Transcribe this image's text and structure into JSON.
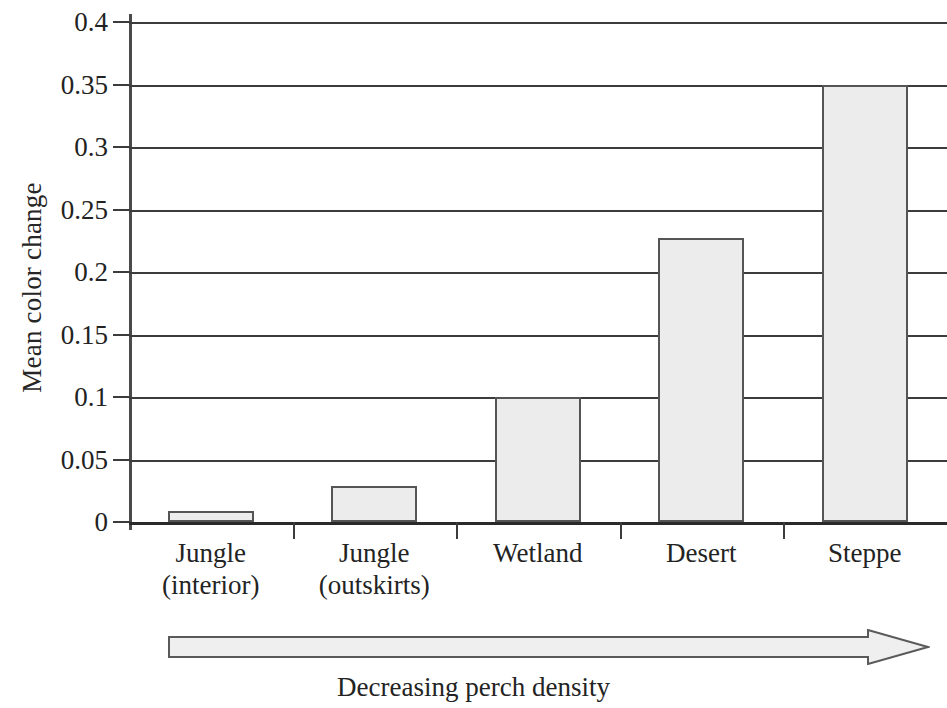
{
  "chart_data": {
    "type": "bar",
    "title": "",
    "xlabel": "",
    "ylabel": "Mean color change",
    "categories": [
      "Jungle\n(interior)",
      "Jungle\n(outskirts)",
      "Wetland",
      "Desert",
      "Steppe"
    ],
    "category_lines": [
      [
        "Jungle",
        "(interior)"
      ],
      [
        "Jungle",
        "(outskirts)"
      ],
      [
        "Wetland",
        ""
      ],
      [
        "Desert",
        ""
      ],
      [
        "Steppe",
        ""
      ]
    ],
    "values": [
      0.009,
      0.029,
      0.1,
      0.227,
      0.35
    ],
    "ylim": [
      0,
      0.4
    ],
    "ytick_values": [
      0,
      0.05,
      0.1,
      0.15,
      0.2,
      0.25,
      0.3,
      0.35,
      0.4
    ],
    "ytick_labels": [
      "0",
      "0.05",
      "0.1",
      "0.15",
      "0.2",
      "0.25",
      "0.3",
      "0.35",
      "0.4"
    ],
    "grid": true,
    "grid_axis": "y",
    "legend": false,
    "legend_position": "none",
    "bar_fill_color": "#ececec",
    "bar_edge_color": "#555555",
    "grid_color": "#3c3c3c",
    "axis_color": "#4a4a4a",
    "background_color": "#ffffff",
    "note": "Right edge of plot is cropped by the image boundary."
  },
  "annotation": {
    "arrow_label": "Decreasing perch density",
    "arrow_direction": "right",
    "arrow_fill_color": "#efefef",
    "arrow_edge_color": "#5a5a5a"
  }
}
